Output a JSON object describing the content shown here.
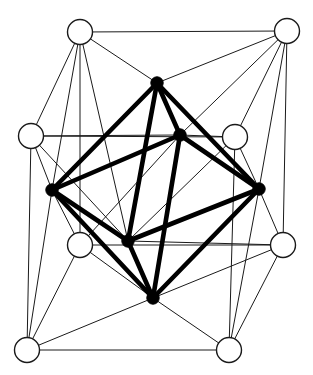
{
  "diagram": {
    "type": "graph-drawing",
    "canvas": {
      "width": 313,
      "height": 375,
      "background": "#ffffff"
    },
    "styles": {
      "thin_edge_color": "#1a1a1a",
      "thin_edge_width": 1,
      "thick_edge_color": "#000000",
      "thick_edge_width": 4.6,
      "hollow_node_fill": "#ffffff",
      "hollow_node_stroke": "#1a1a1a",
      "solid_node_fill": "#000000"
    },
    "node_groups": [
      {
        "id": "cube",
        "label": "Cube vertices",
        "style": "hollow",
        "radius": 12.5,
        "count": 8,
        "nodes": [
          {
            "id": "c0",
            "label": "top-left-outer",
            "x": 80,
            "y": 32
          },
          {
            "id": "c1",
            "label": "top-right-outer",
            "x": 287,
            "y": 31
          },
          {
            "id": "c2",
            "label": "left-upper",
            "x": 31,
            "y": 136
          },
          {
            "id": "c3",
            "label": "right-upper",
            "x": 235,
            "y": 137
          },
          {
            "id": "c4",
            "label": "left-lower",
            "x": 80,
            "y": 245
          },
          {
            "id": "c5",
            "label": "right-lower",
            "x": 283,
            "y": 245
          },
          {
            "id": "c6",
            "label": "bottom-left-outer",
            "x": 27,
            "y": 350
          },
          {
            "id": "c7",
            "label": "bottom-right-outer",
            "x": 229,
            "y": 350
          }
        ]
      },
      {
        "id": "octahedron",
        "label": "Octahedron vertices",
        "style": "solid",
        "radius": 6.2,
        "count": 6,
        "nodes": [
          {
            "id": "o0",
            "label": "apex-top",
            "x": 157,
            "y": 83
          },
          {
            "id": "o1",
            "label": "inner-upper",
            "x": 180,
            "y": 135
          },
          {
            "id": "o2",
            "label": "left",
            "x": 52,
            "y": 190
          },
          {
            "id": "o3",
            "label": "right",
            "x": 259,
            "y": 189
          },
          {
            "id": "o4",
            "label": "inner-lower",
            "x": 128,
            "y": 241
          },
          {
            "id": "o5",
            "label": "apex-bottom",
            "x": 153,
            "y": 298
          }
        ]
      }
    ],
    "edge_groups": [
      {
        "id": "cube-edges",
        "label": "Cube edges (thin)",
        "style": "thin",
        "count": 12,
        "edges": [
          [
            "c0",
            "c1"
          ],
          [
            "c0",
            "c2"
          ],
          [
            "c0",
            "c4"
          ],
          [
            "c1",
            "c3"
          ],
          [
            "c1",
            "c5"
          ],
          [
            "c2",
            "c3"
          ],
          [
            "c2",
            "c6"
          ],
          [
            "c3",
            "c7"
          ],
          [
            "c4",
            "c5"
          ],
          [
            "c4",
            "c6"
          ],
          [
            "c5",
            "c7"
          ],
          [
            "c6",
            "c7"
          ]
        ]
      },
      {
        "id": "incidence-edges",
        "label": "Cube-to-octahedron incidences (thin)",
        "style": "thin",
        "count": 12,
        "edges": [
          [
            "c0",
            "o0"
          ],
          [
            "c0",
            "o2"
          ],
          [
            "c1",
            "o0"
          ],
          [
            "c1",
            "o3"
          ],
          [
            "c2",
            "o2"
          ],
          [
            "c2",
            "o4"
          ],
          [
            "c3",
            "o1"
          ],
          [
            "c3",
            "o3"
          ],
          [
            "c4",
            "o2"
          ],
          [
            "c4",
            "o5"
          ],
          [
            "c5",
            "o3"
          ],
          [
            "c5",
            "o5"
          ]
        ]
      },
      {
        "id": "incidence-edges-2",
        "label": "Further cube-to-octahedron incidences (thin)",
        "style": "thin",
        "count": 10,
        "edges": [
          [
            "c0",
            "o4"
          ],
          [
            "c1",
            "o1"
          ],
          [
            "c2",
            "o1"
          ],
          [
            "c3",
            "o4"
          ],
          [
            "c4",
            "o1"
          ],
          [
            "c5",
            "o4"
          ],
          [
            "c6",
            "o2"
          ],
          [
            "c6",
            "o5"
          ],
          [
            "c7",
            "o3"
          ],
          [
            "c7",
            "o5"
          ]
        ]
      },
      {
        "id": "octahedron-edges",
        "label": "Octahedron edges (thick)",
        "style": "thick",
        "count": 12,
        "edges": [
          [
            "o0",
            "o1"
          ],
          [
            "o0",
            "o2"
          ],
          [
            "o0",
            "o3"
          ],
          [
            "o0",
            "o4"
          ],
          [
            "o1",
            "o2"
          ],
          [
            "o1",
            "o3"
          ],
          [
            "o1",
            "o5"
          ],
          [
            "o2",
            "o4"
          ],
          [
            "o2",
            "o5"
          ],
          [
            "o3",
            "o4"
          ],
          [
            "o3",
            "o5"
          ],
          [
            "o4",
            "o5"
          ]
        ]
      }
    ]
  }
}
